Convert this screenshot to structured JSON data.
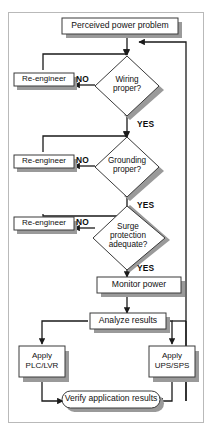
{
  "figure": {
    "frame_color": "#b9b9b9",
    "line_color": "#1a1a1a",
    "shadow_color": "#9a9a9a",
    "shape_fill": "#ffffff",
    "text_color": "#111111"
  },
  "nodes": {
    "start": {
      "label": "Perceived power problem",
      "shape": "rectangle"
    },
    "reengineer_wiring": {
      "label": "Re-engineer",
      "shape": "rectangle"
    },
    "reengineer_grounding": {
      "label": "Re-engineer",
      "shape": "rectangle"
    },
    "reengineer_surge": {
      "label": "Re-engineer",
      "shape": "rectangle"
    },
    "decision_wiring": {
      "label_line1": "Wiring",
      "label_line2": "proper?",
      "shape": "diamond"
    },
    "decision_grounding": {
      "label_line1": "Grounding",
      "label_line2": "proper?",
      "shape": "diamond"
    },
    "decision_surge": {
      "label_line1": "Surge",
      "label_line2": "protection",
      "label_line3": "adequate?",
      "shape": "diamond"
    },
    "monitor": {
      "label": "Monitor power",
      "shape": "rectangle"
    },
    "analyze": {
      "label": "Analyze results",
      "shape": "rectangle"
    },
    "apply_plc": {
      "label_line1": "Apply",
      "label_line2": "PLC/LVR",
      "shape": "rectangle"
    },
    "apply_ups": {
      "label_line1": "Apply",
      "label_line2": "UPS/SPS",
      "shape": "rectangle"
    },
    "verify": {
      "label": "Verify application results",
      "shape": "rounded-rectangle"
    }
  },
  "edge_labels": {
    "no_wiring": "NO",
    "no_grounding": "NO",
    "no_surge": "NO",
    "yes_wiring": "YES",
    "yes_grounding": "YES",
    "yes_surge": "YES"
  }
}
